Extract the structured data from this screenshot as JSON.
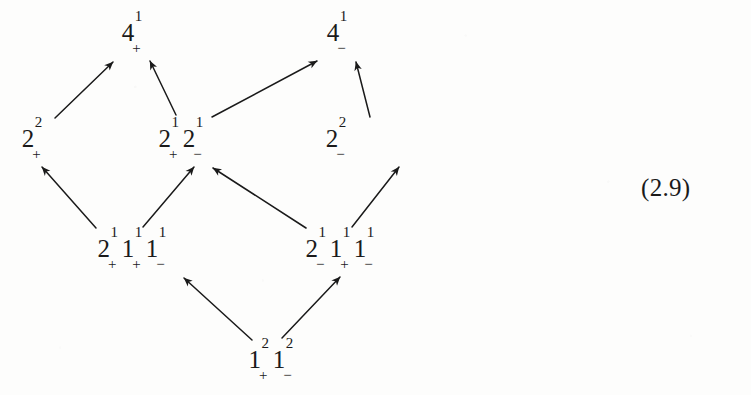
{
  "figure": {
    "kind": "hasse-diagram",
    "equation_number": "(2.9)",
    "background_color": "#fdfdfc",
    "ink_color": "#1a1a1a"
  },
  "nodes": [
    {
      "id": "n-4-plus",
      "name": "node-4-plus",
      "x": 133,
      "y": 35,
      "row": 0,
      "label_plain": "4¹₊",
      "terms": [
        {
          "base": "4",
          "sup": "1",
          "sub": "+"
        }
      ]
    },
    {
      "id": "n-4-minus",
      "name": "node-4-minus",
      "x": 338,
      "y": 35,
      "row": 0,
      "label_plain": "4¹₋",
      "terms": [
        {
          "base": "4",
          "sup": "1",
          "sub": "−"
        }
      ]
    },
    {
      "id": "n-2sq-plus",
      "name": "node-2sq-plus",
      "x": 33,
      "y": 141,
      "row": 1,
      "label_plain": "2²₊",
      "terms": [
        {
          "base": "2",
          "sup": "2",
          "sub": "+"
        }
      ]
    },
    {
      "id": "n-2plus-2minus",
      "name": "node-2plus-2minus",
      "x": 182,
      "y": 141,
      "row": 1,
      "label_plain": "2¹₊2¹₋",
      "terms": [
        {
          "base": "2",
          "sup": "1",
          "sub": "+"
        },
        {
          "base": "2",
          "sup": "1",
          "sub": "−"
        }
      ]
    },
    {
      "id": "n-2sq-minus",
      "name": "node-2sq-minus",
      "x": 337,
      "y": 141,
      "row": 1,
      "label_plain": "2²₋",
      "terms": [
        {
          "base": "2",
          "sup": "2",
          "sub": "−"
        }
      ]
    },
    {
      "id": "n-2plus-1plus-1minus",
      "name": "node-2plus-1plus-1minus",
      "x": 133,
      "y": 251,
      "row": 2,
      "label_plain": "2¹₊1¹₊1¹₋",
      "terms": [
        {
          "base": "2",
          "sup": "1",
          "sub": "+"
        },
        {
          "base": "1",
          "sup": "1",
          "sub": "+"
        },
        {
          "base": "1",
          "sup": "1",
          "sub": "−"
        }
      ]
    },
    {
      "id": "n-2minus-1plus-1minus",
      "name": "node-2minus-1plus-1minus",
      "x": 341,
      "y": 251,
      "row": 2,
      "label_plain": "2¹₋1¹₊1¹₋",
      "terms": [
        {
          "base": "2",
          "sup": "1",
          "sub": "−"
        },
        {
          "base": "1",
          "sup": "1",
          "sub": "+"
        },
        {
          "base": "1",
          "sup": "1",
          "sub": "−"
        }
      ]
    },
    {
      "id": "n-1sq-plus-1sq-minus",
      "name": "node-1sq-plus-1sq-minus",
      "x": 272,
      "y": 362,
      "row": 3,
      "label_plain": "1²₊1²₋",
      "terms": [
        {
          "base": "1",
          "sup": "2",
          "sub": "+"
        },
        {
          "base": "1",
          "sup": "2",
          "sub": "−"
        }
      ]
    }
  ],
  "edges": [
    {
      "name": "edge-2sq-plus-to-4-plus",
      "from": "n-2sq-plus",
      "to": "n-4-plus",
      "x1": 55,
      "y1": 118,
      "x2": 113,
      "y2": 62
    },
    {
      "name": "edge-2plus2minus-to-4-plus",
      "from": "n-2plus-2minus",
      "to": "n-4-plus",
      "x1": 176,
      "y1": 115,
      "x2": 150,
      "y2": 61
    },
    {
      "name": "edge-2plus2minus-to-4-minus",
      "from": "n-2plus-2minus",
      "to": "n-4-minus",
      "x1": 212,
      "y1": 117,
      "x2": 317,
      "y2": 61
    },
    {
      "name": "edge-2sq-minus-to-4-minus",
      "from": "n-2sq-minus",
      "to": "n-4-minus",
      "x1": 370,
      "y1": 117,
      "x2": 356,
      "y2": 62
    },
    {
      "name": "edge-low-left-to-2sq-plus",
      "from": "n-2plus-1plus-1minus",
      "to": "n-2sq-plus",
      "x1": 96,
      "y1": 228,
      "x2": 42,
      "y2": 167
    },
    {
      "name": "edge-low-left-to-2plus2minus",
      "from": "n-2plus-1plus-1minus",
      "to": "n-2plus-2minus",
      "x1": 143,
      "y1": 227,
      "x2": 194,
      "y2": 167
    },
    {
      "name": "edge-low-right-to-2plus2minus",
      "from": "n-2minus-1plus-1minus",
      "to": "n-2plus-2minus",
      "x1": 306,
      "y1": 228,
      "x2": 213,
      "y2": 168
    },
    {
      "name": "edge-low-right-to-2sq-minus",
      "from": "n-2minus-1plus-1minus",
      "to": "n-2sq-minus",
      "x1": 352,
      "y1": 227,
      "x2": 399,
      "y2": 167
    },
    {
      "name": "edge-bottom-to-low-left",
      "from": "n-1sq-plus-1sq-minus",
      "to": "n-2plus-1plus-1minus",
      "x1": 252,
      "y1": 340,
      "x2": 184,
      "y2": 278
    },
    {
      "name": "edge-bottom-to-low-right",
      "from": "n-1sq-plus-1sq-minus",
      "to": "n-2minus-1plus-1minus",
      "x1": 282,
      "y1": 338,
      "x2": 340,
      "y2": 277
    }
  ]
}
